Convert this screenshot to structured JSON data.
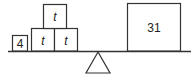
{
  "diagram": {
    "type": "balance-scale",
    "left_pan": {
      "items": [
        {
          "label": "4",
          "kind": "number-box"
        },
        {
          "label": "t",
          "kind": "variable-box"
        },
        {
          "label": "t",
          "kind": "variable-box"
        },
        {
          "label": "t",
          "kind": "variable-box"
        }
      ]
    },
    "right_pan": {
      "items": [
        {
          "label": "31",
          "kind": "number-box"
        }
      ]
    },
    "colors": {
      "stroke": "#333333",
      "background": "#ffffff"
    }
  }
}
